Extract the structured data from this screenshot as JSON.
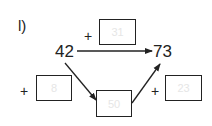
{
  "exercise": {
    "label": "l)",
    "start": "42",
    "end": "73",
    "top_operator": "+",
    "top_box_value": "31",
    "left_operator": "+",
    "left_box_value": "8",
    "middle_box_value": "50",
    "right_operator": "+",
    "right_box_value": "23"
  }
}
